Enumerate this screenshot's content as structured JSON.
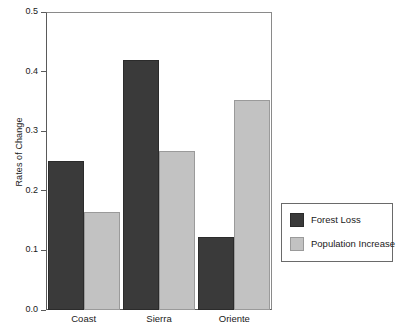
{
  "chart_data": {
    "type": "bar",
    "title": "",
    "xlabel": "",
    "ylabel": "Rates of Change",
    "categories": [
      "Coast",
      "Sierra",
      "Oriente"
    ],
    "series": [
      {
        "name": "Forest Loss",
        "color": "#3a3a3a",
        "values": [
          0.25,
          0.42,
          0.123
        ]
      },
      {
        "name": "Population Increase",
        "color": "#c2c2c2",
        "values": [
          0.165,
          0.267,
          0.352
        ]
      }
    ],
    "ylim": [
      0.0,
      0.5
    ],
    "ytick_labels": [
      "0.0",
      "0.1",
      "0.2",
      "0.3",
      "0.4",
      "0.5"
    ],
    "ytick_values": [
      0.0,
      0.1,
      0.2,
      0.3,
      0.4,
      0.5
    ],
    "grid": false,
    "legend_position": "right-outside"
  },
  "axis": {
    "y_title": "Rates of Change"
  },
  "legend": {
    "entries": [
      {
        "label": "Forest Loss"
      },
      {
        "label": "Population Increase"
      }
    ]
  }
}
